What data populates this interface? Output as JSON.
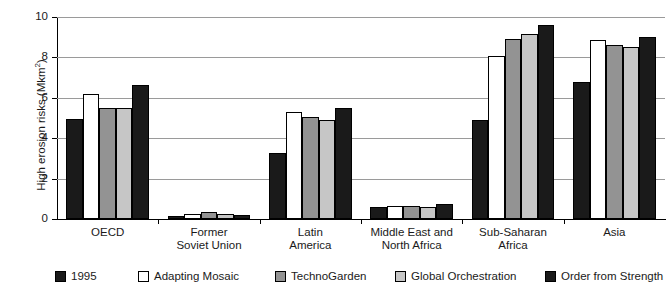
{
  "chart_data": {
    "type": "bar",
    "title": "",
    "subtitle": "",
    "xlabel": "",
    "ylabel": "High erosion risks (Mkm2)",
    "ylabel_html": "High erosion risks (Mkm²)",
    "ylim": [
      0,
      10
    ],
    "yticks": [
      0,
      2,
      4,
      6,
      8,
      10
    ],
    "ytick_labels": [
      "0",
      "2",
      "4",
      "6",
      "8",
      "10"
    ],
    "grid": "horizontal",
    "legend_position": "bottom",
    "categories": [
      "OECD",
      "Former Soviet Union",
      "Latin America",
      "Middle East and North Africa",
      "Sub-Saharan Africa",
      "Asia"
    ],
    "category_label_lines": [
      [
        "OECD"
      ],
      [
        "Former",
        "Soviet Union"
      ],
      [
        "Latin",
        "America"
      ],
      [
        "Middle East and",
        "North Africa"
      ],
      [
        "Sub-Saharan",
        "Africa"
      ],
      [
        "Asia"
      ]
    ],
    "series": [
      {
        "name": "1995",
        "color": "#1a1a1a",
        "values": [
          4.95,
          0.15,
          3.25,
          0.6,
          4.9,
          6.8
        ]
      },
      {
        "name": "Adapting Mosaic",
        "color": "#ffffff",
        "values": [
          6.2,
          0.25,
          5.3,
          0.65,
          8.05,
          8.85
        ]
      },
      {
        "name": "TechnoGarden",
        "color": "#939393",
        "values": [
          5.5,
          0.35,
          5.05,
          0.65,
          8.9,
          8.6
        ]
      },
      {
        "name": "Global Orchestration",
        "color": "#c6c6c6",
        "values": [
          5.5,
          0.25,
          4.9,
          0.6,
          9.15,
          8.5
        ]
      },
      {
        "name": "Order from Strength",
        "color": "#1a1a1a",
        "values": [
          6.65,
          0.2,
          5.5,
          0.75,
          9.6,
          9.0
        ]
      }
    ]
  },
  "legend": {
    "items": [
      {
        "label": "1995",
        "color": "#1a1a1a"
      },
      {
        "label": "Adapting Mosaic",
        "color": "#ffffff"
      },
      {
        "label": "TechnoGarden",
        "color": "#939393"
      },
      {
        "label": "Global Orchestration",
        "color": "#c6c6c6"
      },
      {
        "label": "Order from Strength",
        "color": "#1a1a1a"
      }
    ]
  },
  "axis": {
    "y_title_main": "High erosion risks (Mkm",
    "y_title_sup": "2",
    "y_title_tail": ")"
  }
}
